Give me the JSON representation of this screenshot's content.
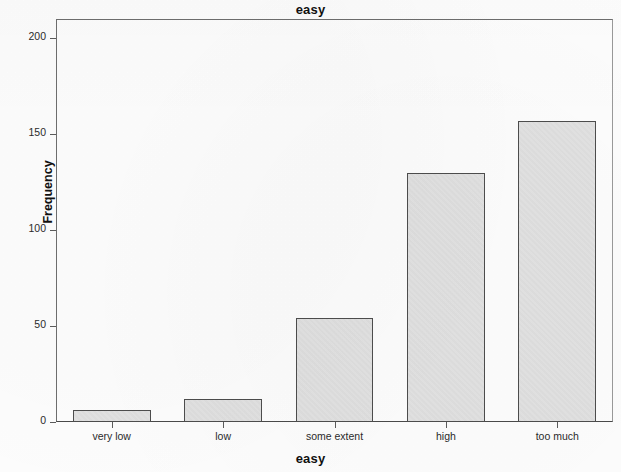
{
  "chart_data": {
    "type": "bar",
    "title": "easy",
    "xlabel": "easy",
    "ylabel": "Frequency",
    "categories": [
      "very low",
      "low",
      "some extent",
      "high",
      "too much"
    ],
    "values": [
      6,
      12,
      54,
      130,
      157
    ],
    "ylim": [
      0,
      210
    ],
    "yticks": [
      0,
      50,
      100,
      150,
      200
    ],
    "ytick_labels": [
      "0",
      "50",
      "100",
      "150",
      "200"
    ],
    "grid": false,
    "legend": false,
    "bar_fill_color": "#e2e2e2",
    "bar_edge_color": "#4d4d4d",
    "background_color": "#fdfdfd"
  },
  "axes": {
    "y_ticks": [
      {
        "label": "200",
        "value": 200
      },
      {
        "label": "150",
        "value": 150
      },
      {
        "label": "100",
        "value": 100
      },
      {
        "label": "50",
        "value": 50
      },
      {
        "label": "0",
        "value": 0
      }
    ],
    "x_ticks": [
      {
        "label": "very low",
        "value": 6
      },
      {
        "label": "low",
        "value": 12
      },
      {
        "label": "some extent",
        "value": 54
      },
      {
        "label": "high",
        "value": 130
      },
      {
        "label": "too much",
        "value": 157
      }
    ]
  }
}
